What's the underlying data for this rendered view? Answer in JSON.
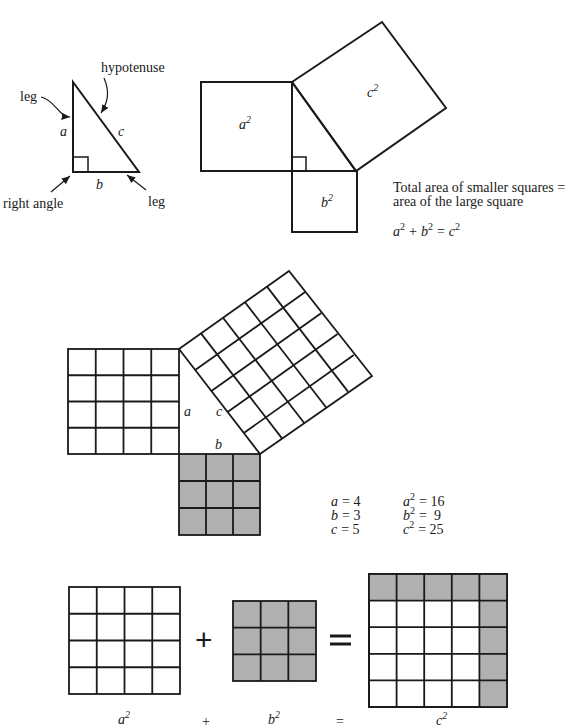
{
  "triangle": {
    "labels": {
      "leg_top": "leg",
      "hypotenuse": "hypotenuse",
      "a": "a",
      "c": "c",
      "b": "b",
      "right_angle": "right angle",
      "leg_bottom": "leg"
    }
  },
  "squares_diagram": {
    "a_sq": "a",
    "b_sq": "b",
    "c_sq": "c",
    "exp": "2"
  },
  "statement": {
    "line1": "Total area of smaller squares =",
    "line2": "area of the large square",
    "eq_a": "a",
    "eq_b": "b",
    "eq_c": "c",
    "eq_exp": "2",
    "eq_plus": "+",
    "eq_equals": "="
  },
  "grid_diagram": {
    "a": "a",
    "b": "b",
    "c": "c",
    "shade_color": "#b0b0b0"
  },
  "values": {
    "rows": [
      {
        "var": "a",
        "val": "= 4",
        "sq_var": "a",
        "sq_val": "= 16"
      },
      {
        "var": "b",
        "val": "= 3",
        "sq_var": "b",
        "sq_val": "=  9"
      },
      {
        "var": "c",
        "val": "= 5",
        "sq_var": "c",
        "sq_val": "= 25"
      }
    ]
  },
  "bottom_equation": {
    "plus": "+",
    "equals": "=",
    "label_a": "a",
    "label_b": "b",
    "label_c": "c",
    "label_plus": "+",
    "label_equals": "=",
    "exp": "2"
  }
}
